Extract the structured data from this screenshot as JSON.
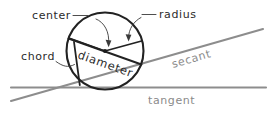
{
  "diagram": {
    "background_color": "#ffffff",
    "stroke_color_dark": "#222222",
    "stroke_color_gray": "#8d8d8d",
    "label_color_dark": "#2b2b2b",
    "label_color_gray": "#8a8a8a",
    "labels": {
      "center": "center",
      "radius": "radius",
      "chord": "chord",
      "diameter": "diameter",
      "secant": "secant",
      "tangent": "tangent"
    },
    "geometry": {
      "circle": {
        "cx": 105,
        "cy": 51,
        "r": 38.5
      },
      "center_point": {
        "x": 105,
        "y": 51
      },
      "radius_left": {
        "x1": 105,
        "y1": 51,
        "x2": 68.5,
        "y2": 38.5
      },
      "radius_right": {
        "x1": 105,
        "y1": 51,
        "x2": 141.5,
        "y2": 41
      },
      "diameter": {
        "x1": 68.5,
        "y1": 38.5,
        "x2": 141.5,
        "y2": 64.5
      },
      "chord": {
        "x1": 74,
        "y1": 42,
        "x2": 79.5,
        "y2": 85
      },
      "secant": {
        "x1": 11,
        "y1": 101,
        "x2": 263,
        "y2": 29
      },
      "tangent": {
        "x1": 11,
        "y1": 87.5,
        "x2": 266,
        "y2": 87.5
      }
    }
  }
}
